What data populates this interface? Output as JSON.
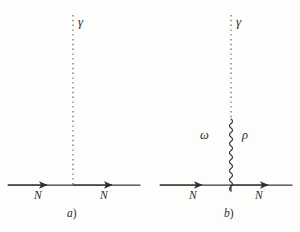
{
  "figure": {
    "kind": "feynman-diagrams",
    "background_color": "#fdfdfc",
    "line_color": "#3a3a3a",
    "text_color": "#2b2b2b"
  },
  "panels": [
    {
      "id": "a",
      "caption": "a",
      "caption_paren": ")",
      "photon_label": "γ",
      "incoming_nucleon_label": "N",
      "outgoing_nucleon_label": "N",
      "meson_labels": [],
      "propagator_style": "dotted",
      "has_meson_propagator": false
    },
    {
      "id": "b",
      "caption": "b",
      "caption_paren": ")",
      "photon_label": "γ",
      "incoming_nucleon_label": "N",
      "outgoing_nucleon_label": "N",
      "meson_labels": [
        "ω",
        "ρ"
      ],
      "propagator_style": "dotted-plus-wavy",
      "has_meson_propagator": true
    }
  ],
  "geometry": {
    "baseline_y": 185,
    "panel_a_vertex_x": 73,
    "panel_b_vertex_x": 231,
    "photon_top_y": 15,
    "wavy_top_y": 119,
    "wavy_amplitude": 3,
    "wavy_period": 9
  }
}
